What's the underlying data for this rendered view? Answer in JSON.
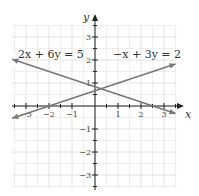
{
  "chart_data": {
    "type": "line",
    "title": "",
    "xlabel": "x",
    "ylabel": "y",
    "xlim": [
      -3.5,
      3.5
    ],
    "ylim": [
      -3.5,
      3.5
    ],
    "grid": true,
    "x_ticks": [
      "-3",
      "-2",
      "-1",
      "1",
      "2",
      "3"
    ],
    "y_ticks": [
      "3",
      "2",
      "1",
      "-1",
      "-2",
      "-3"
    ],
    "series": [
      {
        "name": "2x + 6y = 5",
        "slope": -0.3333,
        "intercept": 0.8333,
        "x": [
          -3.6,
          3.5
        ],
        "y": [
          2.03,
          -0.33
        ]
      },
      {
        "name": "−x + 3y = 2",
        "slope": 0.3333,
        "intercept": 0.6667,
        "x": [
          -3.6,
          3.5
        ],
        "y": [
          -0.53,
          1.83
        ]
      }
    ],
    "annotations": [
      {
        "text": "2x + 6y = 5",
        "x": -3.4,
        "y": 2.3
      },
      {
        "text": "−x + 3y = 2",
        "x": 1.7,
        "y": 2.3
      }
    ],
    "intersection": [
      0.25,
      0.75
    ]
  }
}
